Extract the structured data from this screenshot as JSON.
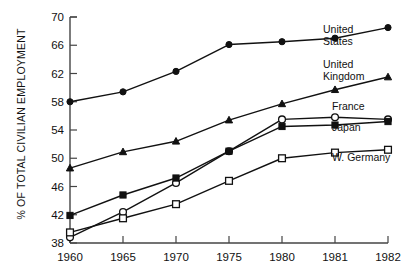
{
  "chart_data": {
    "type": "line",
    "title": "",
    "subtitle": "",
    "xlabel": "",
    "ylabel": "% OF TOTAL CIVILIAN EMPLOYMENT",
    "x": [
      1960,
      1965,
      1970,
      1975,
      1980,
      1981,
      1982
    ],
    "xtick_labels": [
      "1960",
      "1965",
      "1970",
      "1975",
      "1980",
      "1981",
      "1982"
    ],
    "ytick_labels": [
      "38",
      "42",
      "46",
      "50",
      "54",
      "58",
      "62",
      "66",
      "70"
    ],
    "yticks": [
      38,
      42,
      46,
      50,
      54,
      58,
      62,
      66,
      70
    ],
    "ylim": [
      38,
      70
    ],
    "xlim_index": [
      0,
      6
    ],
    "grid": false,
    "legend_position": "right-inline",
    "series": [
      {
        "name": "United States",
        "label": "United\nStates",
        "label_line1": "United",
        "label_line2": "States",
        "marker": "filled-circle",
        "color": "#111111",
        "values": [
          58.0,
          59.4,
          62.3,
          66.1,
          66.5,
          67.0,
          68.5
        ]
      },
      {
        "name": "United Kingdom",
        "label": "United\nKingdom",
        "label_line1": "United",
        "label_line2": "Kingdom",
        "marker": "filled-triangle",
        "color": "#111111",
        "values": [
          48.6,
          50.9,
          52.4,
          55.4,
          57.7,
          59.7,
          61.5
        ]
      },
      {
        "name": "France",
        "label": "France",
        "label_line1": "France",
        "label_line2": "",
        "marker": "open-circle",
        "color": "#111111",
        "values": [
          38.8,
          42.4,
          46.5,
          51.0,
          55.5,
          55.8,
          55.5
        ]
      },
      {
        "name": "Japan",
        "label": "Japan",
        "label_line1": "Japan",
        "label_line2": "",
        "marker": "filled-square",
        "color": "#111111",
        "values": [
          41.9,
          44.8,
          47.2,
          51.0,
          54.5,
          54.7,
          55.2
        ]
      },
      {
        "name": "W. Germany",
        "label": "W. Germany",
        "label_line1": "W. Germany",
        "label_line2": "",
        "marker": "open-square",
        "color": "#111111",
        "values": [
          39.5,
          41.5,
          43.5,
          46.8,
          50.0,
          50.8,
          51.2
        ]
      }
    ],
    "legend_anchor": {
      "United States": {
        "x": 323,
        "y": 33,
        "y2": 45
      },
      "United Kingdom": {
        "x": 323,
        "y": 68,
        "y2": 80
      },
      "France": {
        "x": 332,
        "y": 110,
        "y2": 0
      },
      "Japan": {
        "x": 332,
        "y": 131,
        "y2": 0
      },
      "W. Germany": {
        "x": 332,
        "y": 161,
        "y2": 0
      }
    }
  },
  "layout": {
    "plot_left": 70,
    "plot_right": 388,
    "plot_top": 17,
    "plot_bottom": 243
  }
}
